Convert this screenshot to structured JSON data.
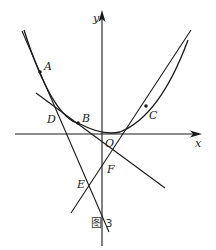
{
  "figure": {
    "caption": "图 3",
    "axes": {
      "x_label": "x",
      "y_label": "y",
      "origin_label": "O"
    },
    "points": {
      "A": "A",
      "B": "B",
      "C": "C",
      "D": "D",
      "E": "E",
      "F": "F"
    },
    "elements": [
      "parabola",
      "tangent line at A",
      "tangent line at B",
      "tangent line at C"
    ],
    "colors": {
      "stroke": "#1a1a1a",
      "background": "#ffffff"
    }
  }
}
